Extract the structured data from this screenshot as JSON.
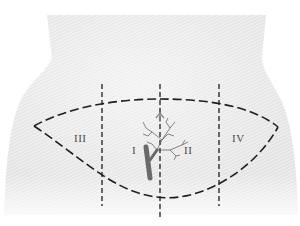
{
  "diagram": {
    "type": "anatomical-abdomen-regions",
    "colors": {
      "background": "#ffffff",
      "skin_light": "#ededed",
      "skin_shade": "#d2d2d2",
      "dash_line": "#1e1e1e",
      "vessel": "#6a6a6a",
      "branch": "#555555",
      "label": "#4a4a4a"
    },
    "regions": [
      {
        "id": "I",
        "label": "I",
        "x": 133,
        "y": 150
      },
      {
        "id": "II",
        "label": "II",
        "x": 184,
        "y": 150
      },
      {
        "id": "III",
        "label": "III",
        "x": 78,
        "y": 138
      },
      {
        "id": "IV",
        "label": "IV",
        "x": 234,
        "y": 138
      }
    ],
    "vertical_lines_x": [
      102,
      160,
      219
    ],
    "lens": {
      "left_tip": [
        34,
        126
      ],
      "right_tip": [
        278,
        127
      ],
      "top_mid_y": 99,
      "bottom_mid_y": 199
    }
  }
}
